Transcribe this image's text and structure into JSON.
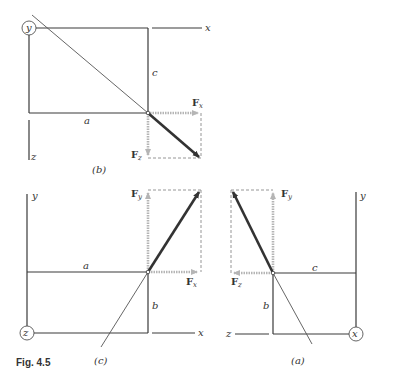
{
  "figure": {
    "label": "Fig. 4.5"
  },
  "panels": {
    "b": {
      "caption": "(b)",
      "origin_axis": "y",
      "axis_right": "x",
      "axis_down": "z",
      "dim_horizontal": "a",
      "dim_vertical": "c",
      "force_x": "F",
      "force_x_sub": "x",
      "force_z": "F",
      "force_z_sub": "z"
    },
    "c": {
      "caption": "(c)",
      "origin_axis": "z",
      "axis_up": "y",
      "axis_right": "x",
      "dim_horizontal": "a",
      "dim_vertical": "b",
      "force_y": "F",
      "force_y_sub": "y",
      "force_x": "F",
      "force_x_sub": "x"
    },
    "a": {
      "caption": "(a)",
      "origin_axis": "x",
      "axis_up": "y",
      "axis_left": "z",
      "dim_horizontal": "c",
      "dim_vertical": "b",
      "force_y": "F",
      "force_y_sub": "y",
      "force_z": "F",
      "force_z_sub": "z"
    }
  },
  "colors": {
    "line": "#3a3a3a",
    "force": "#333333",
    "component": "#b5b5b5",
    "dashed": "#8a8a8a"
  }
}
